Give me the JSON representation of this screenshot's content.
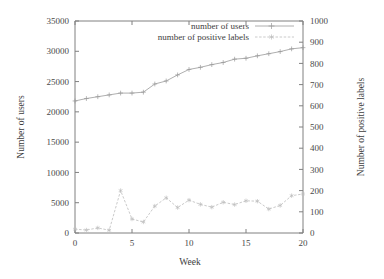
{
  "chart_data": {
    "type": "line",
    "title": "",
    "xlabel": "Week",
    "ylabel": "Number of users",
    "y2label": "Number of positive labels",
    "xlim": [
      0,
      20
    ],
    "ylim": [
      0,
      35000
    ],
    "y2lim": [
      0,
      1000
    ],
    "xticks": [
      "0",
      "5",
      "10",
      "15",
      "20"
    ],
    "yticks": [
      "0",
      "5000",
      "10000",
      "15000",
      "20000",
      "25000",
      "30000",
      "35000"
    ],
    "y2ticks": [
      "0",
      "100",
      "200",
      "300",
      "400",
      "500",
      "600",
      "700",
      "800",
      "900",
      "1000"
    ],
    "grid": false,
    "legend_position": "top-right-inside",
    "x": [
      0,
      1,
      2,
      3,
      4,
      5,
      6,
      7,
      8,
      9,
      10,
      11,
      12,
      13,
      14,
      15,
      16,
      17,
      18,
      19,
      20
    ],
    "series": [
      {
        "name": "number of users",
        "axis": "left",
        "marker": "plus",
        "linestyle": "solid",
        "color": "#9a9a9a",
        "values": [
          21800,
          22200,
          22500,
          22800,
          23100,
          23100,
          23250,
          24600,
          25100,
          26100,
          27000,
          27350,
          27800,
          28150,
          28700,
          28850,
          29250,
          29600,
          29950,
          30400,
          30600
        ]
      },
      {
        "name": "number of positive labels",
        "axis": "right",
        "marker": "star",
        "linestyle": "dashed",
        "color": "#bdbdbd",
        "values": [
          18,
          14,
          24,
          13,
          200,
          66,
          52,
          127,
          166,
          120,
          155,
          135,
          122,
          145,
          134,
          152,
          150,
          113,
          130,
          176,
          184
        ]
      }
    ]
  },
  "legend": {
    "entries": [
      {
        "label": "number of users"
      },
      {
        "label": "number of positive labels"
      }
    ]
  },
  "axes": {
    "x_label": "Week",
    "y_left_label": "Number of users",
    "y_right_label": "Number of positive labels"
  }
}
